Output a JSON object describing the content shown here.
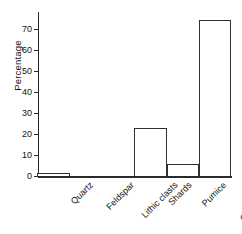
{
  "chart_data": {
    "type": "bar",
    "title": "",
    "xlabel": "",
    "ylabel": "Percentage",
    "categories": [
      "Quartz",
      "Feldspar",
      "Lithic clasts",
      "Shards",
      "Pumice",
      "Groundmass"
    ],
    "values": [
      1.5,
      0,
      0,
      23,
      6,
      74
    ],
    "ylim": [
      0,
      78
    ],
    "yticks": [
      0,
      10,
      20,
      30,
      40,
      50,
      60,
      70
    ],
    "ytick_labels": [
      "0",
      "10",
      "20",
      "30",
      "40",
      "50",
      "60",
      "70"
    ],
    "grid": false,
    "legend": false,
    "bar_fill": "#ffffff",
    "bar_edge": "#2f2f2f",
    "axis_color": "#2a2a2a",
    "xtick_rotation": -45
  }
}
